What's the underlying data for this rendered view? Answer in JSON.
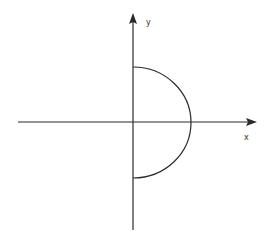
{
  "diagram": {
    "type": "coordinate-plane",
    "axes": {
      "x_label": "x",
      "y_label": "y"
    },
    "curve": {
      "shape": "semicircle",
      "side": "right",
      "description": "right half of a circle centered at the origin"
    },
    "colors": {
      "line": "#2a2a2a",
      "background": "#ffffff"
    }
  }
}
